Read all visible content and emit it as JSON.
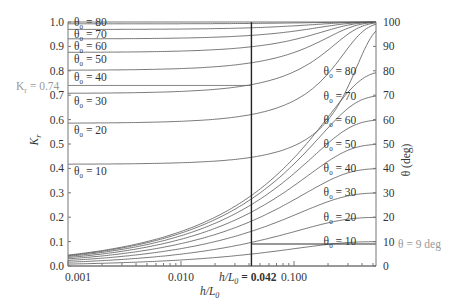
{
  "chart_data": {
    "type": "line",
    "title": "",
    "xlabel": "h/L0",
    "ylabel_left": "Kr",
    "ylabel_right": "θ (deg)",
    "xscale": "log",
    "xlim": [
      0.001,
      0.53
    ],
    "ylim_left": [
      0.0,
      1.0
    ],
    "ylim_right": [
      0,
      100
    ],
    "x_ticks": [
      "0.001",
      "0.010",
      "0.100"
    ],
    "x_tick_values": [
      0.001,
      0.01,
      0.1
    ],
    "y_left_ticks": [
      "0.0",
      "0.1",
      "0.2",
      "0.3",
      "0.4",
      "0.5",
      "0.6",
      "0.7",
      "0.8",
      "0.9",
      "1.0"
    ],
    "y_right_ticks": [
      "0",
      "10",
      "20",
      "30",
      "40",
      "50",
      "60",
      "70",
      "80",
      "90",
      "100"
    ],
    "grid": false,
    "annotations": {
      "kr_marker": "Kr = 0.74",
      "kr_marker_value": 0.74,
      "vline_label": "h/L0 = 0.042",
      "vline_value": 0.042,
      "hline_label": "θ = 9 deg",
      "hline_value": 9
    },
    "series_Kr": [
      {
        "name": "θ0 = 80",
        "theta0": 80,
        "deep_water_Kr": 1.0
      },
      {
        "name": "θ0 = 70",
        "theta0": 70,
        "deep_water_Kr": 0.97
      },
      {
        "name": "θ0 = 60",
        "theta0": 60,
        "deep_water_Kr": 0.93
      },
      {
        "name": "θ0 = 50",
        "theta0": 50,
        "deep_water_Kr": 0.88
      },
      {
        "name": "θ0 = 40",
        "theta0": 40,
        "deep_water_Kr": 0.81
      },
      {
        "name": "θ0 = 30",
        "theta0": 30,
        "deep_water_Kr": 0.71
      },
      {
        "name": "θ0 = 20",
        "theta0": 20,
        "deep_water_Kr": 0.585
      },
      {
        "name": "θ0 = 10",
        "theta0": 10,
        "deep_water_Kr": 0.42
      }
    ],
    "series_theta": [
      {
        "name": "θ0 = 80",
        "theta0": 80
      },
      {
        "name": "θ0 = 70",
        "theta0": 70
      },
      {
        "name": "θ0 = 60",
        "theta0": 60
      },
      {
        "name": "θ0 = 50",
        "theta0": 50
      },
      {
        "name": "θ0 = 40",
        "theta0": 40
      },
      {
        "name": "θ0 = 30",
        "theta0": 30
      },
      {
        "name": "θ0 = 20",
        "theta0": 20
      },
      {
        "name": "θ0 = 10",
        "theta0": 10
      }
    ]
  },
  "labels": {
    "kr_axis": "K",
    "kr_sub": "r",
    "theta_axis": "θ (deg)",
    "x_axis_main": "h/L",
    "x_axis_sub": "0",
    "vline_value_text": " = 0.042",
    "kr_marker_text": " = 0.74",
    "hline_text": "θ = 9 deg",
    "theta0_prefix": "θ",
    "theta0_sub": "0"
  }
}
